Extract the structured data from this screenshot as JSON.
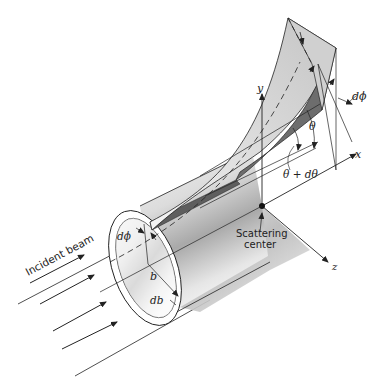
{
  "diagram": {
    "labels": {
      "incident_beam": "Incident beam",
      "scattering_center_line1": "Scattering",
      "scattering_center_line2": "center",
      "axis_x": "x",
      "axis_y": "y",
      "axis_z": "z",
      "theta": "θ",
      "theta_dtheta": "θ + dθ",
      "dphi_top": "dϕ",
      "dphi_ring": "dϕ",
      "b": "b",
      "db": "db"
    },
    "colors": {
      "line": "#222222",
      "surface_light": "#e4e4e4",
      "surface_mid": "#bdbdbd",
      "surface_dark": "#7a7a7a",
      "background": "#ffffff"
    }
  }
}
